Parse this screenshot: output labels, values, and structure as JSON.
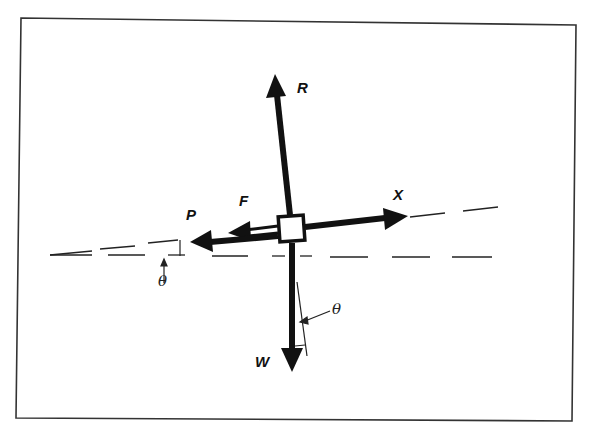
{
  "diagram": {
    "type": "free-body force diagram",
    "frame_color": "#333333",
    "ink_color": "#111111",
    "body": {
      "shape": "square",
      "label": ""
    },
    "forces": [
      {
        "name": "R",
        "label": "R",
        "direction": "up"
      },
      {
        "name": "X",
        "label": "X",
        "direction": "right (along incline)"
      },
      {
        "name": "F",
        "label": "F",
        "direction": "left (along incline)"
      },
      {
        "name": "P",
        "label": "P",
        "direction": "left (along incline)"
      },
      {
        "name": "W",
        "label": "W",
        "direction": "down"
      }
    ],
    "angles": [
      {
        "label": "θ",
        "location": "between incline line and horizontal"
      },
      {
        "label": "θ",
        "location": "between weight vector and normal"
      }
    ],
    "reference_lines": [
      {
        "name": "horizontal",
        "style": "dashed"
      },
      {
        "name": "incline",
        "style": "dashed"
      }
    ]
  }
}
